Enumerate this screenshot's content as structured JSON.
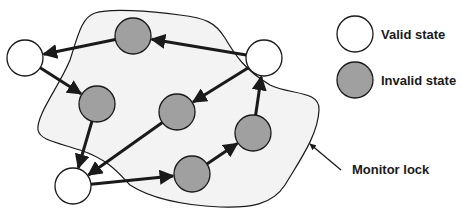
{
  "diagram": {
    "region": {
      "label": "Monitor lock",
      "fill": "#f3f3f3",
      "stroke": "#1a1a1a"
    },
    "colors": {
      "valid_fill": "#ffffff",
      "invalid_fill": "#a0a0a0",
      "stroke": "#1a1a1a"
    },
    "nodes": [
      {
        "id": "A",
        "type": "valid",
        "cx": 25,
        "cy": 58
      },
      {
        "id": "B",
        "type": "invalid",
        "cx": 133,
        "cy": 36
      },
      {
        "id": "C",
        "type": "valid",
        "cx": 264,
        "cy": 58
      },
      {
        "id": "D",
        "type": "invalid",
        "cx": 97,
        "cy": 104
      },
      {
        "id": "E",
        "type": "invalid",
        "cx": 177,
        "cy": 112
      },
      {
        "id": "F",
        "type": "invalid",
        "cx": 253,
        "cy": 133
      },
      {
        "id": "G",
        "type": "valid",
        "cx": 73,
        "cy": 186
      },
      {
        "id": "H",
        "type": "invalid",
        "cx": 192,
        "cy": 174
      }
    ],
    "edges": [
      {
        "from": "B",
        "to": "A"
      },
      {
        "from": "C",
        "to": "B"
      },
      {
        "from": "A",
        "to": "D"
      },
      {
        "from": "C",
        "to": "E"
      },
      {
        "from": "D",
        "to": "G"
      },
      {
        "from": "E",
        "to": "G"
      },
      {
        "from": "G",
        "to": "H"
      },
      {
        "from": "H",
        "to": "F"
      },
      {
        "from": "F",
        "to": "C"
      }
    ]
  },
  "legend": {
    "valid_label": "Valid state",
    "invalid_label": "Invalid state"
  },
  "annotation": {
    "monitor_lock_label": "Monitor lock"
  }
}
